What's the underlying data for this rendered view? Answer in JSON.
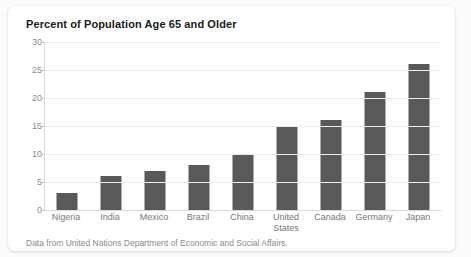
{
  "card": {
    "title": "Percent of Population Age 65 and Older",
    "footnote": "Data from United Nations Department of Economic and Social Affairs."
  },
  "colors": {
    "bar": "#595959",
    "gridline": "#ececec",
    "axis": "#d8d8d8",
    "title_text": "#1a1a1a",
    "tick_text": "#8c8c8c",
    "category_text": "#777777",
    "footnote_text": "#8a8a8a",
    "card_background": "#ffffff",
    "page_background": "#fbfbfb"
  },
  "chart_data": {
    "type": "bar",
    "title": "Percent of Population Age 65 and Older",
    "subtitle": "",
    "xlabel": "",
    "ylabel": "",
    "categories": [
      "Nigeria",
      "India",
      "Mexico",
      "Brazil",
      "China",
      "United States",
      "Canada",
      "Germany",
      "Japan"
    ],
    "values": [
      3,
      6,
      7,
      8,
      10,
      15,
      16,
      21,
      26
    ],
    "ylim": [
      0,
      30
    ],
    "yticks": [
      0,
      5,
      10,
      15,
      20,
      25,
      30
    ],
    "ytick_labels": [
      "0",
      "5",
      "10",
      "15",
      "20",
      "25",
      "30"
    ],
    "grid": "horizontal",
    "legend": "none",
    "annotations": [
      "Data from United Nations Department of Economic and Social Affairs."
    ]
  }
}
